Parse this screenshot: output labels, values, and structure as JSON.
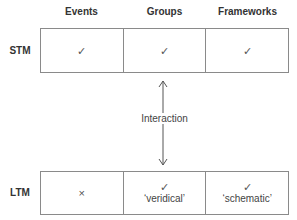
{
  "columns": [
    "Events",
    "Groups",
    "Frameworks"
  ],
  "rows": [
    {
      "label": "STM",
      "cells": [
        {
          "mark": "✓",
          "note": ""
        },
        {
          "mark": "✓",
          "note": ""
        },
        {
          "mark": "✓",
          "note": ""
        }
      ]
    },
    {
      "label": "LTM",
      "cells": [
        {
          "mark": "×",
          "note": ""
        },
        {
          "mark": "✓",
          "note": "‘veridical’"
        },
        {
          "mark": "✓",
          "note": "‘schematic’"
        }
      ]
    }
  ],
  "connector": {
    "label": "Interaction",
    "direction": "bidirectional"
  }
}
